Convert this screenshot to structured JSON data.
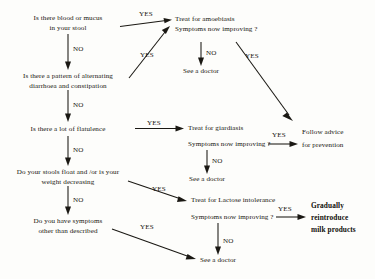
{
  "diagram": {
    "colors": {
      "background": "#fdfdfb",
      "ink": "#17150f",
      "line": "#1a1813"
    },
    "questions": {
      "q1_line1": "Is there blood or mucus",
      "q1_line2": "in your stool",
      "q2_line1": "Is there a pattern of alternating",
      "q2_line2": "diarrhoea and constipation",
      "q3_line1": "Is there a lot of flatulence",
      "q4_line1": "Do your stools float and /or is your",
      "q4_line2": "weight decreasing",
      "q5_line1": "Do you have symptoms",
      "q5_line2": "other than described"
    },
    "treatments": {
      "amoebiasis_line1": "Treat for amoebiasis",
      "amoebiasis_line2": "Symptoms now improving ?",
      "giardiasis_line1": "Treat for giardiasis",
      "giardiasis_line2": "Symptoms now improving ?",
      "lactose_line1": "Treat for Lactose intolerance",
      "lactose_line2": "Symptoms now improving ?"
    },
    "outcomes": {
      "doctor_1": "See a doctor",
      "doctor_2": "See a doctor",
      "doctor_3": "See a doctor",
      "doctor_4": "See a doctor",
      "prevention_line1": "Follow advice",
      "prevention_line2": "for prevention",
      "milk_line1": "Gradually",
      "milk_line2": "reintroduce",
      "milk_line3": "milk products"
    },
    "edge_labels": {
      "yes_q1": "YES",
      "no_q1": "NO",
      "yes_amoeba_loop": "YES",
      "no_amoeba": "NO",
      "yes_amoeba_improving": "YES",
      "no_q2": "NO",
      "yes_q3": "YES",
      "no_q3": "NO",
      "no_giardia": "NO",
      "yes_giardia_improving": "YES",
      "yes_q4": "YES",
      "no_q4": "NO",
      "no_lactose": "NO",
      "yes_lactose_improving": "YES",
      "yes_q5": "YES"
    }
  }
}
